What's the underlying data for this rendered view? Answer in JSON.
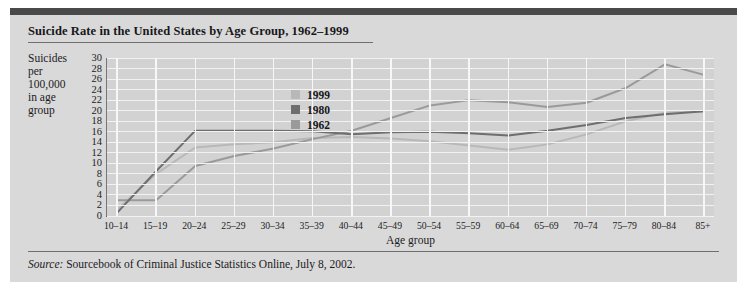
{
  "page": {
    "title": "Suicide Rate in the United States by Age Group, 1962–1999",
    "axis_y_label_lines": [
      "Suicides",
      "per",
      "100,000",
      "in age",
      "group"
    ],
    "source_prefix": "Source:",
    "source_text": " Sourcebook of Criminal Justice Statistics Online, July 8, 2002."
  },
  "colors": {
    "page_bg": "#d9d9d9",
    "plot_bg": "#d2d2d2",
    "grid": "#f2f2f2",
    "top_bar": "#4a4a4a",
    "series_1999": "#b8b8b8",
    "series_1980": "#6e6e6e",
    "series_1962": "#9a9a9a",
    "text": "#1b1b1e"
  },
  "chart_data": {
    "type": "line",
    "title": "Suicide Rate in the United States by Age Group, 1962–1999",
    "xlabel": "Age group",
    "ylabel": "Suicides per 100,000 in age group",
    "ylim": [
      0,
      30
    ],
    "ytick_step": 2,
    "yticks": [
      30,
      28,
      26,
      24,
      22,
      20,
      18,
      16,
      14,
      12,
      10,
      8,
      6,
      4,
      2,
      0
    ],
    "grid": true,
    "legend_position": "inside-upper-center",
    "categories": [
      "10–14",
      "15–19",
      "20–24",
      "25–29",
      "30–34",
      "35–39",
      "40–44",
      "45–49",
      "50–54",
      "55–59",
      "60–64",
      "65–69",
      "70–74",
      "75–79",
      "80–84",
      "85+"
    ],
    "series": [
      {
        "name": "1999",
        "color": "#b8b8b8",
        "values": [
          1.2,
          8.0,
          13.0,
          13.6,
          14.0,
          14.8,
          15.0,
          14.7,
          14.2,
          13.4,
          12.6,
          13.6,
          15.5,
          18.0,
          19.6,
          19.9
        ]
      },
      {
        "name": "1980",
        "color": "#6e6e6e",
        "values": [
          0.6,
          8.5,
          16.2,
          16.2,
          16.2,
          16.1,
          15.5,
          15.9,
          16.0,
          15.7,
          15.3,
          16.2,
          17.3,
          18.6,
          19.3,
          19.9
        ]
      },
      {
        "name": "1962",
        "color": "#9a9a9a",
        "values": [
          3.0,
          3.0,
          9.5,
          11.4,
          12.8,
          14.6,
          16.2,
          18.6,
          21.0,
          22.0,
          21.6,
          20.7,
          21.5,
          24.3,
          28.8,
          26.8
        ]
      }
    ]
  },
  "legend": {
    "items": [
      {
        "label": "1999",
        "color": "#b8b8b8"
      },
      {
        "label": "1980",
        "color": "#6e6e6e"
      },
      {
        "label": "1962",
        "color": "#9a9a9a"
      }
    ]
  }
}
